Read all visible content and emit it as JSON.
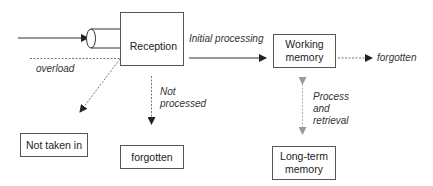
{
  "diagram": {
    "nodes": {
      "reception": "Reception",
      "working_memory": [
        "Working",
        "memory"
      ],
      "long_term_memory": [
        "Long-term",
        "memory"
      ],
      "not_taken_in": "Not taken in",
      "forgotten_box": "forgotten"
    },
    "edge_labels": {
      "overload": "overload",
      "initial_processing": "Initial processing",
      "not_processed": [
        "Not",
        "processed"
      ],
      "forgotten_out": "forgotten",
      "process_retrieval": [
        "Process",
        "and",
        "retrieval"
      ]
    },
    "colors": {
      "line": "#333333",
      "bidirectional_arrow": "#999999"
    }
  }
}
